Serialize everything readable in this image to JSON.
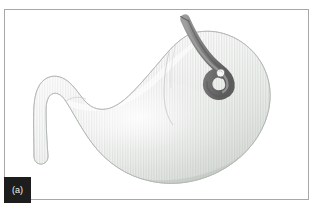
{
  "figure": {
    "panel_label": "(a)",
    "caption_text": "",
    "frame": {
      "border_color": "#a8a8a8",
      "background_color": "#ffffff"
    },
    "label_box": {
      "background_color": "#1d1d1d",
      "text_color": "#f2f2f2"
    }
  },
  "illustration": {
    "title": "Stomach cross-section with endoscope in retroflexion",
    "anatomy": {
      "name": "stomach",
      "fill_light": "#fbfbfb",
      "fill_mid": "#e6e8e6",
      "fill_shadow": "#cfd3cf",
      "outline_color": "#b9bdb9",
      "rugae_stripe_color": "#cfd3cf",
      "parts": [
        {
          "name": "fundus",
          "label": "fundus"
        },
        {
          "name": "body",
          "label": "body"
        },
        {
          "name": "antrum",
          "label": "antrum"
        },
        {
          "name": "pylorus",
          "label": "pylorus"
        },
        {
          "name": "duodenal-bulb",
          "label": "duodenal bulb"
        },
        {
          "name": "lesser-curvature",
          "label": "lesser curvature"
        },
        {
          "name": "greater-curvature",
          "label": "greater curvature"
        }
      ]
    },
    "instrument": {
      "name": "endoscope",
      "shaft_color": "#7b7b7b",
      "shaft_shadow_color": "#606060",
      "shaft_highlight_color": "#9a9a9a",
      "tip_cap_color": "#f5f5f5",
      "tip_cap_outline": "#6f6f6f",
      "shaft_width_px": 9,
      "entry_point": {
        "x": 185,
        "y": 18
      },
      "tip_point": {
        "x": 227,
        "y": 80
      },
      "configuration": "retroflexed-J-hook"
    },
    "background_color": "#ffffff"
  }
}
